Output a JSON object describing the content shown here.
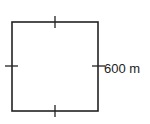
{
  "diagram": {
    "shape": "square",
    "side_label": "600 m",
    "stroke_color": "#222222",
    "equal_side_ticks": 4
  }
}
